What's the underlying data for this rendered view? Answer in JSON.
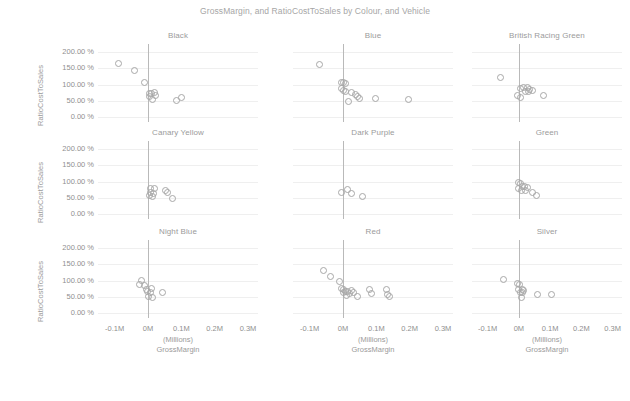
{
  "chart_data": {
    "type": "scatter",
    "title": "GrossMargin, and RatioCostToSales by Colour, and Vehicle",
    "xlabel": "GrossMargin",
    "xunits": "(Millions)",
    "ylabel": "RatioCostToSales",
    "xlim": [
      -0.15,
      0.33
    ],
    "ylim": [
      -0.15,
      2.25
    ],
    "xticks": [
      "-0.1M",
      "0M",
      "0.1M",
      "0.2M",
      "0.3M"
    ],
    "xtickvals": [
      -0.1,
      0,
      0.1,
      0.2,
      0.3
    ],
    "yticks": [
      "200.00 %",
      "150.00 %",
      "100.00 %",
      "50.00 %",
      "0.00 %"
    ],
    "ytickvals": [
      2.0,
      1.5,
      1.0,
      0.5,
      0.0
    ],
    "grid": true,
    "legend": "none",
    "reference_line_x": 0,
    "facet_by": "Colour",
    "facet_rows": 3,
    "facet_cols": 3,
    "panels": [
      {
        "title": "Black",
        "points": [
          {
            "x": -0.088,
            "y": 1.66
          },
          {
            "x": -0.042,
            "y": 1.44
          },
          {
            "x": -0.012,
            "y": 1.06
          },
          {
            "x": 0.004,
            "y": 0.74
          },
          {
            "x": 0.01,
            "y": 0.72
          },
          {
            "x": 0.018,
            "y": 0.75
          },
          {
            "x": 0.021,
            "y": 0.68
          },
          {
            "x": 0.012,
            "y": 0.55
          },
          {
            "x": 0.085,
            "y": 0.52
          },
          {
            "x": 0.1,
            "y": 0.59
          },
          {
            "x": 0.003,
            "y": 0.62
          }
        ]
      },
      {
        "title": "Blue",
        "points": [
          {
            "x": -0.072,
            "y": 1.62
          },
          {
            "x": -0.006,
            "y": 1.08
          },
          {
            "x": 0.0,
            "y": 1.06
          },
          {
            "x": 0.006,
            "y": 1.02
          },
          {
            "x": -0.004,
            "y": 0.88
          },
          {
            "x": 0.002,
            "y": 0.83
          },
          {
            "x": 0.008,
            "y": 0.8
          },
          {
            "x": 0.026,
            "y": 0.76
          },
          {
            "x": 0.036,
            "y": 0.7
          },
          {
            "x": 0.044,
            "y": 0.62
          },
          {
            "x": 0.05,
            "y": 0.56
          },
          {
            "x": 0.016,
            "y": 0.47
          },
          {
            "x": 0.098,
            "y": 0.58
          },
          {
            "x": 0.196,
            "y": 0.55
          }
        ]
      },
      {
        "title": "British Racing Green",
        "points": [
          {
            "x": -0.058,
            "y": 1.22
          },
          {
            "x": 0.004,
            "y": 0.88
          },
          {
            "x": 0.014,
            "y": 0.92
          },
          {
            "x": 0.026,
            "y": 0.9
          },
          {
            "x": 0.034,
            "y": 0.86
          },
          {
            "x": 0.044,
            "y": 0.82
          },
          {
            "x": 0.02,
            "y": 0.78
          },
          {
            "x": 0.03,
            "y": 0.8
          },
          {
            "x": -0.004,
            "y": 0.66
          },
          {
            "x": 0.004,
            "y": 0.6
          },
          {
            "x": 0.078,
            "y": 0.66
          }
        ]
      },
      {
        "title": "Canary Yellow",
        "points": [
          {
            "x": 0.006,
            "y": 0.78
          },
          {
            "x": 0.018,
            "y": 0.8
          },
          {
            "x": 0.008,
            "y": 0.66
          },
          {
            "x": 0.016,
            "y": 0.64
          },
          {
            "x": 0.004,
            "y": 0.58
          },
          {
            "x": 0.014,
            "y": 0.55
          },
          {
            "x": 0.052,
            "y": 0.74
          },
          {
            "x": 0.058,
            "y": 0.66
          },
          {
            "x": 0.074,
            "y": 0.48
          }
        ]
      },
      {
        "title": "Dark Purple",
        "points": [
          {
            "x": -0.004,
            "y": 0.68
          },
          {
            "x": 0.014,
            "y": 0.76
          },
          {
            "x": 0.026,
            "y": 0.62
          },
          {
            "x": 0.058,
            "y": 0.55
          }
        ]
      },
      {
        "title": "Green",
        "points": [
          {
            "x": 0.0,
            "y": 0.96
          },
          {
            "x": 0.004,
            "y": 0.93
          },
          {
            "x": 0.01,
            "y": 0.86
          },
          {
            "x": 0.018,
            "y": 0.84
          },
          {
            "x": 0.028,
            "y": 0.82
          },
          {
            "x": 0.008,
            "y": 0.74
          },
          {
            "x": 0.02,
            "y": 0.72
          },
          {
            "x": 0.042,
            "y": 0.68
          },
          {
            "x": 0.056,
            "y": 0.56
          },
          {
            "x": -0.002,
            "y": 0.78
          }
        ]
      },
      {
        "title": "Night Blue",
        "points": [
          {
            "x": -0.02,
            "y": 1.0
          },
          {
            "x": -0.026,
            "y": 0.88
          },
          {
            "x": -0.01,
            "y": 0.84
          },
          {
            "x": -0.004,
            "y": 0.74
          },
          {
            "x": 0.01,
            "y": 0.76
          },
          {
            "x": -0.002,
            "y": 0.66
          },
          {
            "x": 0.006,
            "y": 0.62
          },
          {
            "x": 0.002,
            "y": 0.5
          },
          {
            "x": 0.012,
            "y": 0.48
          },
          {
            "x": 0.044,
            "y": 0.62
          }
        ]
      },
      {
        "title": "Red",
        "points": [
          {
            "x": -0.06,
            "y": 1.3
          },
          {
            "x": -0.038,
            "y": 1.12
          },
          {
            "x": -0.012,
            "y": 0.98
          },
          {
            "x": -0.006,
            "y": 0.76
          },
          {
            "x": 0.0,
            "y": 0.72
          },
          {
            "x": 0.006,
            "y": 0.68
          },
          {
            "x": 0.002,
            "y": 0.62
          },
          {
            "x": 0.014,
            "y": 0.66
          },
          {
            "x": 0.02,
            "y": 0.6
          },
          {
            "x": 0.026,
            "y": 0.7
          },
          {
            "x": 0.032,
            "y": 0.64
          },
          {
            "x": 0.044,
            "y": 0.52
          },
          {
            "x": 0.08,
            "y": 0.74
          },
          {
            "x": 0.084,
            "y": 0.6
          },
          {
            "x": 0.13,
            "y": 0.72
          },
          {
            "x": 0.134,
            "y": 0.58
          },
          {
            "x": 0.138,
            "y": 0.5
          },
          {
            "x": 0.01,
            "y": 0.54
          }
        ]
      },
      {
        "title": "Silver",
        "points": [
          {
            "x": -0.048,
            "y": 1.04
          },
          {
            "x": -0.004,
            "y": 0.92
          },
          {
            "x": 0.002,
            "y": 0.88
          },
          {
            "x": 0.0,
            "y": 0.72
          },
          {
            "x": 0.01,
            "y": 0.74
          },
          {
            "x": 0.016,
            "y": 0.7
          },
          {
            "x": 0.006,
            "y": 0.64
          },
          {
            "x": 0.012,
            "y": 0.62
          },
          {
            "x": 0.008,
            "y": 0.48
          },
          {
            "x": 0.06,
            "y": 0.56
          },
          {
            "x": 0.104,
            "y": 0.56
          }
        ]
      }
    ]
  },
  "colors": {
    "marker_stroke": "#a8a8a8",
    "gridline": "#efefef",
    "zeroline": "#b9b9b9",
    "text": "#8f8f8f",
    "title": "#a6a6a6",
    "background": "#ffffff"
  }
}
